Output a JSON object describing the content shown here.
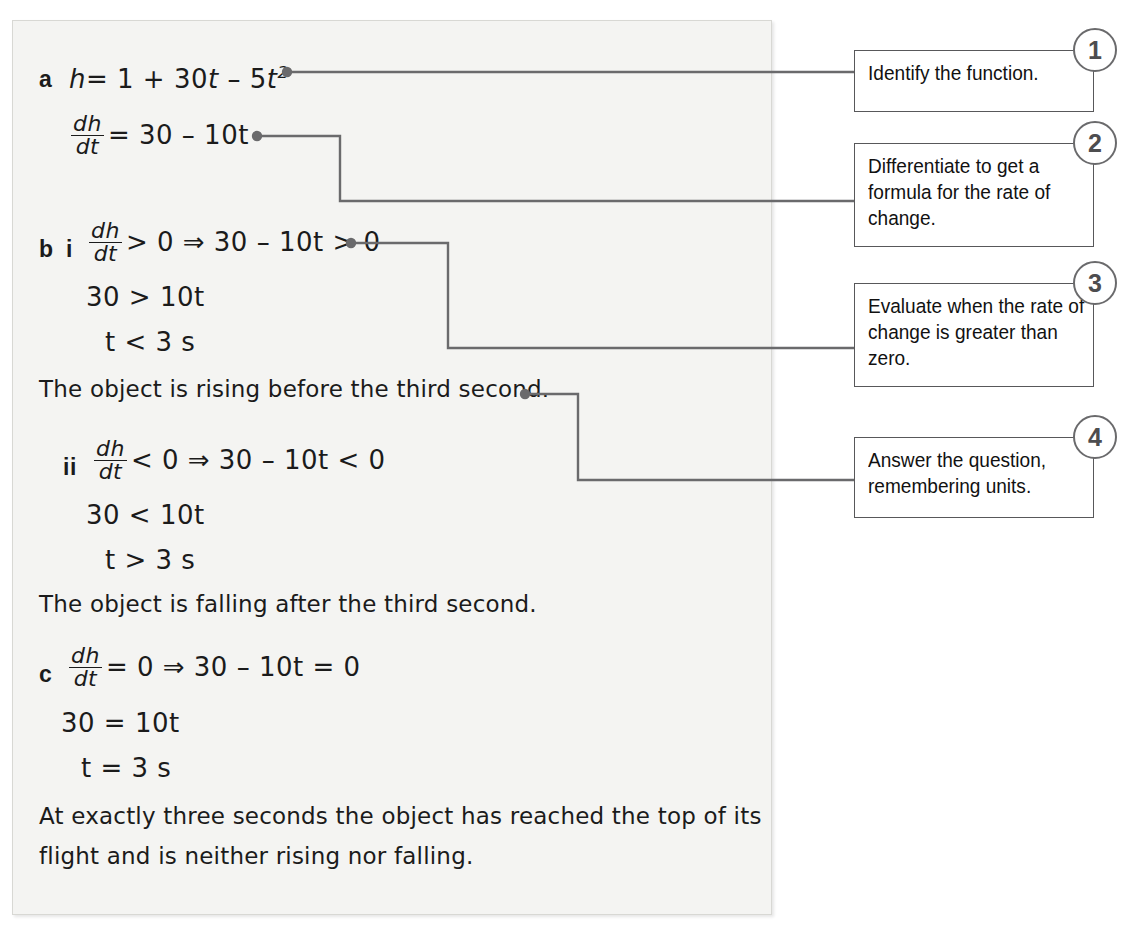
{
  "solution": {
    "lines": [
      {
        "id": "a-h",
        "label": "a",
        "sublabel": "",
        "expr": "h = 1 + 30t – 5t²"
      },
      {
        "id": "a-dhdt",
        "label": "",
        "sublabel": "",
        "expr": "dh/dt = 30 – 10t"
      },
      {
        "id": "b-i",
        "label": "b",
        "sublabel": "i",
        "expr": "dh/dt > 0 ⇒ 30 – 10t > 0"
      },
      {
        "id": "b-i-2",
        "label": "",
        "sublabel": "",
        "expr": "30 > 10t"
      },
      {
        "id": "b-i-3",
        "label": "",
        "sublabel": "",
        "expr": "t < 3 s"
      },
      {
        "id": "prose-1",
        "label": "",
        "sublabel": "",
        "expr": "The object is rising before the third second."
      },
      {
        "id": "b-ii",
        "label": "",
        "sublabel": "ii",
        "expr": "dh/dt < 0 ⇒ 30 – 10t < 0"
      },
      {
        "id": "b-ii-2",
        "label": "",
        "sublabel": "",
        "expr": "30 < 10t"
      },
      {
        "id": "b-ii-3",
        "label": "",
        "sublabel": "",
        "expr": "t > 3 s"
      },
      {
        "id": "prose-2",
        "label": "",
        "sublabel": "",
        "expr": "The object is falling after the third second."
      },
      {
        "id": "c",
        "label": "c",
        "sublabel": "",
        "expr": "dh/dt = 0 ⇒ 30 – 10t = 0"
      },
      {
        "id": "c-2",
        "label": "",
        "sublabel": "",
        "expr": "30 = 10t"
      },
      {
        "id": "c-3",
        "label": "",
        "sublabel": "",
        "expr": "t = 3 s"
      }
    ],
    "label_a": "a",
    "label_b": "b",
    "label_c": "c",
    "label_i": "i",
    "label_ii": "ii",
    "eq_a_h_lhs": "h",
    "eq_a_h_eq": "= 1 + 30",
    "eq_a_h_t": "t",
    "eq_a_h_minus": " – 5",
    "eq_a_h_t2": "t",
    "eq_a_h_pow": "2",
    "frac_num": "dh",
    "frac_den": "dt",
    "eq_a_dhdt_rhs": "= 30 – 10t",
    "eq_bi_rhs": "> 0 ⇒ 30 – 10t > 0",
    "eq_bi_2": "30 > 10t",
    "eq_bi_3": "t < 3 s",
    "prose_1": "The object is rising before the third second.",
    "eq_bii_rhs": "< 0 ⇒ 30 – 10t < 0",
    "eq_bii_2": "30 < 10t",
    "eq_bii_3": "t > 3 s",
    "prose_2": "The object is falling after the third second.",
    "eq_c_rhs": "= 0 ⇒ 30 – 10t = 0",
    "eq_c_2": "30 = 10t",
    "eq_c_3": "t = 3 s",
    "prose_3_line1": "At exactly three seconds the object has reached the top of its",
    "prose_3_line2": "flight and is neither rising nor falling."
  },
  "callouts": [
    {
      "number": "1",
      "text": "Identify the function."
    },
    {
      "number": "2",
      "text": "Differentiate to get a formula for the rate of change."
    },
    {
      "number": "3",
      "text": "Evaluate when the rate of change is greater than zero."
    },
    {
      "number": "4",
      "text": "Answer the question, remembering units."
    }
  ],
  "colors": {
    "panel_background": "#f4f4f2",
    "panel_border": "#d8d8d4",
    "ink": "#1b1b1b",
    "connector": "#6a6a6c",
    "callout_border": "#58585a",
    "badge_text": "#4d4d4f",
    "page_background": "#ffffff"
  }
}
